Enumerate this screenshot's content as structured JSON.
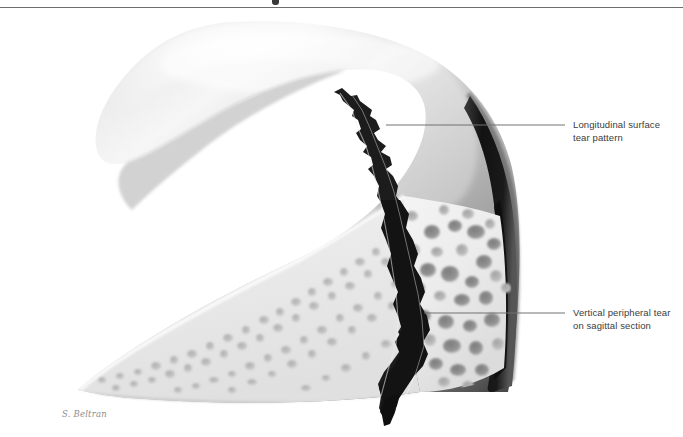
{
  "figure": {
    "kind": "medical-illustration",
    "background_color": "#ffffff",
    "border": {
      "top_rule_color": "#6e6e6e",
      "top_rule_y": 7
    },
    "palette": {
      "cartilage_light": "#f2f2f2",
      "cartilage_mid": "#b9b9b9",
      "cartilage_dark": "#6f6f6f",
      "cortical_edge": "#171717",
      "bone_light": "#efefef",
      "bone_mid": "#d8d8d8",
      "marrow_dark": "#8a8a8a",
      "tear_color": "#1c1c1c",
      "leader_line": "#707070",
      "label_text": "#3b3b3b",
      "signature": "#8d8d8d"
    }
  },
  "annotations": [
    {
      "id": "longitudinal-surface-tear",
      "line1": "Longitudinal surface",
      "line2": "tear pattern",
      "text_x": 573,
      "text_y": 119,
      "leader": {
        "x1": 386,
        "y1": 125,
        "x2": 565,
        "y2": 125
      }
    },
    {
      "id": "vertical-peripheral-tear",
      "line1": "Vertical peripheral tear",
      "line2": "on sagittal section",
      "text_x": 573,
      "text_y": 307,
      "leader": {
        "x1": 424,
        "y1": 313,
        "x2": 565,
        "y2": 313
      }
    }
  ],
  "signature": {
    "text": "S. Beltran",
    "x": 62,
    "y": 409
  }
}
